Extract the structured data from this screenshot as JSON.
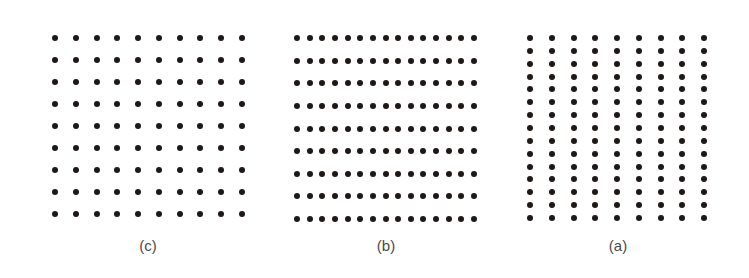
{
  "figure": {
    "dot_color": "#1e1916",
    "label_color": "#4a4a4a",
    "panels": [
      {
        "id": "c",
        "label": "(c)",
        "description": "square dot lattice, equal spacing",
        "columns": 10,
        "rows": 9,
        "x_start": 55,
        "x_end": 242,
        "y_start": 38,
        "y_end": 214,
        "dot_size": 6,
        "label_x": 148,
        "label_y": 238
      },
      {
        "id": "b",
        "label": "(b)",
        "description": "dots grouped into horizontal rows (close horizontal spacing)",
        "columns": 15,
        "rows": 9,
        "x_start": 297,
        "x_end": 474,
        "y_start": 38,
        "y_end": 219,
        "dot_size": 6,
        "label_x": 386,
        "label_y": 238
      },
      {
        "id": "a",
        "label": "(a)",
        "description": "dots grouped into vertical columns (close vertical spacing)",
        "columns": 9,
        "rows": 15,
        "x_start": 530,
        "x_end": 704,
        "y_start": 38,
        "y_end": 218,
        "dot_size": 6,
        "label_x": 618,
        "label_y": 238
      }
    ]
  }
}
